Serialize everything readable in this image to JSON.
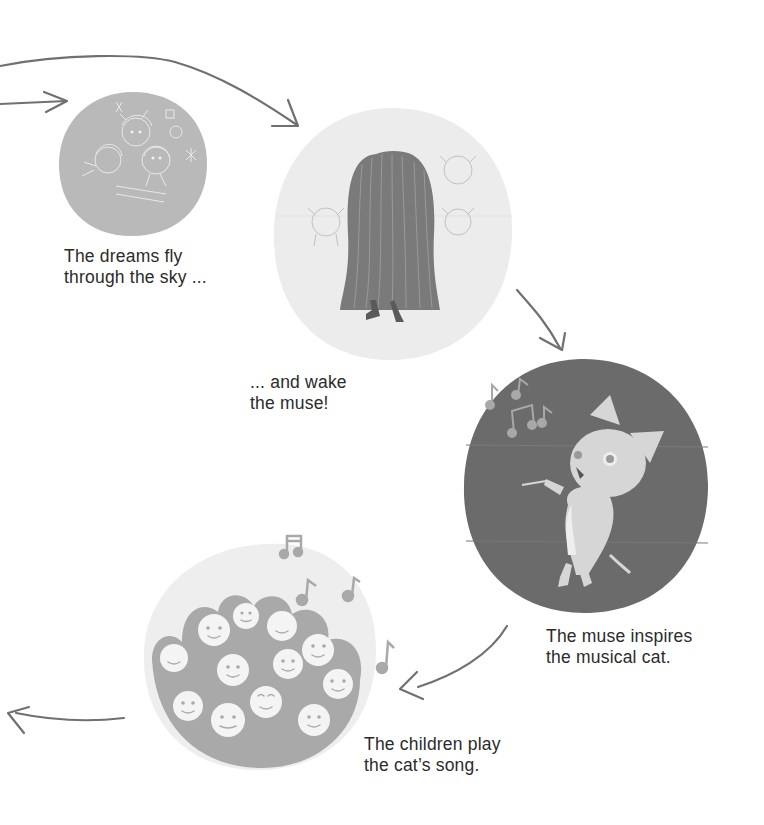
{
  "diagram": {
    "type": "cycle",
    "colors": {
      "background": "#ffffff",
      "text": "#2b2b2b",
      "arrow": "#707070",
      "dreams_blob": "#b9b9b9",
      "muse_blob": "#ececec",
      "cat_blob": "#6b6b6b",
      "cat": "#d6d6d6",
      "children_blob": "#a9a9a9",
      "children_bg": "#eeeeee",
      "faces": "#f4f4f4"
    },
    "steps": [
      {
        "id": "dreams",
        "icon": "dreams-sketch-icon",
        "caption": "The dreams fly\nthrough the sky ..."
      },
      {
        "id": "muse",
        "icon": "long-haired-muse-icon",
        "caption": "... and wake\nthe muse!"
      },
      {
        "id": "cat",
        "icon": "conductor-cat-icon",
        "caption": "The muse inspires\nthe musical cat."
      },
      {
        "id": "children",
        "icon": "singing-children-icon",
        "caption": "The children play\nthe cat’s song."
      }
    ]
  }
}
